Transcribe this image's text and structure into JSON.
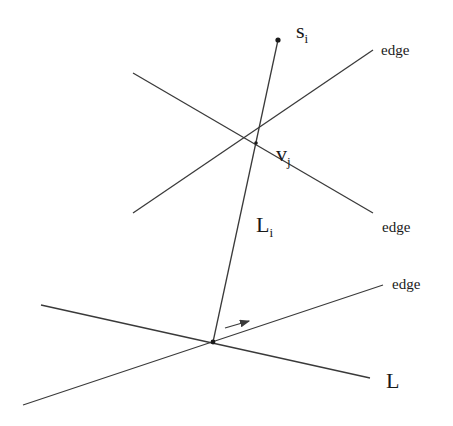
{
  "diagram": {
    "type": "geometric-construction",
    "labels": {
      "site": "s",
      "site_sub": "i",
      "vertex": "v",
      "vertex_sub": "j",
      "segment": "L",
      "segment_sub": "i",
      "line": "L",
      "edge_top": "edge",
      "edge_mid": "edge",
      "edge_bottom": "edge"
    },
    "points": {
      "site_s_i": [
        278,
        40
      ],
      "vertex_v_j": [
        256,
        143
      ],
      "base_point": [
        213,
        342
      ]
    },
    "lines": [
      {
        "name": "edge-line-upper-rising",
        "from": [
          133,
          213
        ],
        "to": [
          373,
          50
        ],
        "label": "edge"
      },
      {
        "name": "edge-line-upper-falling",
        "from": [
          133,
          73
        ],
        "to": [
          373,
          213
        ],
        "label": "edge"
      },
      {
        "name": "segment-L-i",
        "from": [
          278,
          40
        ],
        "to": [
          213,
          342
        ],
        "label": "L_i"
      },
      {
        "name": "edge-line-lower",
        "from": [
          23,
          405
        ],
        "to": [
          383,
          285
        ],
        "label": "edge"
      },
      {
        "name": "line-L",
        "from": [
          41,
          305
        ],
        "to": [
          370,
          378
        ],
        "label": "L"
      }
    ],
    "arrow": {
      "from": [
        225,
        328
      ],
      "to": [
        250,
        321
      ]
    },
    "colors": {
      "stroke": "#3a3a3a",
      "text": "#1a1a1a",
      "background": "#ffffff"
    }
  }
}
